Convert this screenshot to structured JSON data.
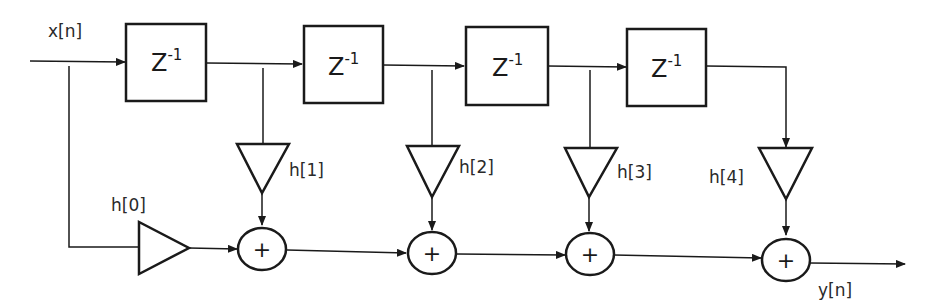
{
  "diagram": {
    "type": "FIR filter direct-form block diagram",
    "input_label": "x[n]",
    "output_label": "y[n]",
    "delay_label": "Z",
    "delay_exponent": "-1",
    "delays": [
      {
        "label": "Z",
        "exp": "-1"
      },
      {
        "label": "Z",
        "exp": "-1"
      },
      {
        "label": "Z",
        "exp": "-1"
      },
      {
        "label": "Z",
        "exp": "-1"
      }
    ],
    "gains": [
      {
        "label": "h[0]"
      },
      {
        "label": "h[1]"
      },
      {
        "label": "h[2]"
      },
      {
        "label": "h[3]"
      },
      {
        "label": "h[4]"
      }
    ],
    "adders": [
      {
        "symbol": "+"
      },
      {
        "symbol": "+"
      },
      {
        "symbol": "+"
      },
      {
        "symbol": "+"
      }
    ],
    "colors": {
      "stroke": "#1a1a1a",
      "background": "#ffffff"
    }
  }
}
